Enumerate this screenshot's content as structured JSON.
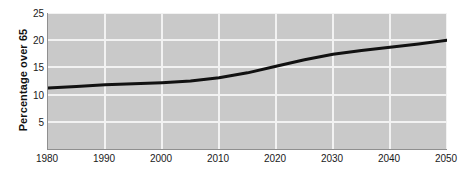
{
  "chart_data": {
    "type": "line",
    "title": "",
    "xlabel": "",
    "ylabel": "Percentage over 65",
    "xlim": [
      1980,
      2050
    ],
    "ylim": [
      0,
      25
    ],
    "grid": true,
    "legend": false,
    "xticks": [
      1980,
      1990,
      2000,
      2010,
      2020,
      2030,
      2040,
      2050
    ],
    "yticks": [
      5,
      10,
      15,
      20,
      25
    ],
    "x": [
      1980,
      1985,
      1990,
      1995,
      2000,
      2005,
      2010,
      2015,
      2020,
      2025,
      2030,
      2035,
      2040,
      2045,
      2050
    ],
    "values": [
      11.2,
      11.5,
      11.8,
      12.0,
      12.2,
      12.5,
      13.1,
      14.0,
      15.2,
      16.4,
      17.4,
      18.1,
      18.7,
      19.3,
      20.0
    ],
    "series": [
      {
        "name": "Percentage over 65",
        "values": [
          11.2,
          11.5,
          11.8,
          12.0,
          12.2,
          12.5,
          13.1,
          14.0,
          15.2,
          16.4,
          17.4,
          18.1,
          18.7,
          19.3,
          20.0
        ],
        "color": "#111111",
        "line_width": 3
      }
    ],
    "colors": {
      "plot_background": "#c9c9c9",
      "figure_background": "#ffffff",
      "gridline": "#f2f2f2",
      "axis": "#8f8f8f",
      "line": "#111111",
      "text": "#1a1a1a"
    }
  }
}
